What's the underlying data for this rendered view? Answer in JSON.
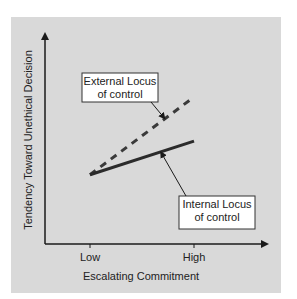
{
  "chart_data": {
    "type": "line",
    "title": "",
    "xlabel": "Escalating Commitment",
    "ylabel": "Tendency Toward Unethical Decision",
    "categories": [
      "Low",
      "High"
    ],
    "ylim": [
      0,
      10
    ],
    "series": [
      {
        "name": "External Locus of control",
        "style": "dashed",
        "values": [
          3.3,
          7.0
        ]
      },
      {
        "name": "Internal Locus of control",
        "style": "solid",
        "values": [
          3.3,
          4.9
        ]
      }
    ],
    "annotations": [
      {
        "text_lines": [
          "External Locus",
          "of control"
        ],
        "target_series": 0
      },
      {
        "text_lines": [
          "Internal Locus",
          "of control"
        ],
        "target_series": 1
      }
    ],
    "grid": false,
    "legend": "none"
  },
  "colors": {
    "panel": "#d9d9d9",
    "dashed_line": "#3a3a3a",
    "solid_line": "#2b2b2b",
    "axis": "#1a1a1a"
  }
}
